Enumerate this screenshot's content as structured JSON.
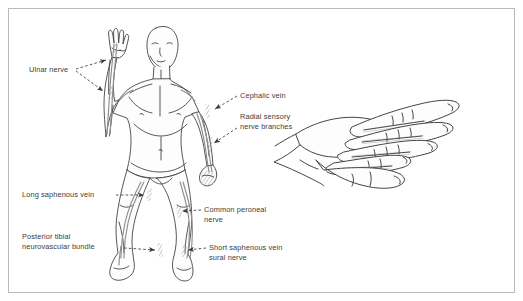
{
  "figure": {
    "kind": "anatomical-line-drawing",
    "border_color": "#b9b9b9",
    "background_color": "#ffffff",
    "ink_color": "#3a3a3a",
    "vessel_color": "#8e8e8e",
    "label_color": "#3c3c3c",
    "hatch_color": "#9a9a9a"
  },
  "panels": [
    {
      "id": "whole-body",
      "name": "Anterior whole body figure, right arm raised"
    },
    {
      "id": "hand-lateral",
      "name": "Lateral view of hand with extended fingers"
    }
  ],
  "labels": [
    {
      "id": "ulnar-nerve",
      "lines": [
        "Ulnar nerve"
      ],
      "text_x": 29,
      "text_y": 72,
      "anchor": "start",
      "leaders": [
        {
          "from_x": 76,
          "from_y": 69,
          "to_x": 110,
          "to_y": 61
        },
        {
          "from_x": 76,
          "from_y": 71,
          "to_x": 106,
          "to_y": 92
        }
      ]
    },
    {
      "id": "cephalic-vein",
      "lines": [
        "Cephalic vein"
      ],
      "text_x": 240,
      "text_y": 98,
      "anchor": "start",
      "leaders": [
        {
          "from_x": 237,
          "from_y": 96,
          "to_x": 214,
          "to_y": 108
        }
      ]
    },
    {
      "id": "radial-sensory-nerve-branches",
      "lines": [
        "Radial sensory",
        "nerve branches"
      ],
      "text_x": 240,
      "text_y": 119,
      "anchor": "start",
      "leaders": [
        {
          "from_x": 237,
          "from_y": 128,
          "to_x": 212,
          "to_y": 142
        }
      ]
    },
    {
      "id": "long-saphenous-vein",
      "lines": [
        "Long saphenous vein"
      ],
      "text_x": 22,
      "text_y": 197,
      "anchor": "start",
      "leaders": [
        {
          "from_x": 116,
          "from_y": 195,
          "to_x": 146,
          "to_y": 195
        }
      ]
    },
    {
      "id": "posterior-tibial-neurovascular-bundle",
      "lines": [
        "Posterior tibial",
        "neurovascular bundle"
      ],
      "text_x": 22,
      "text_y": 239,
      "anchor": "start",
      "leaders": [
        {
          "from_x": 124,
          "from_y": 248,
          "to_x": 158,
          "to_y": 250
        }
      ]
    },
    {
      "id": "common-peroneal-nerve",
      "lines": [
        "Common peroneal",
        "nerve"
      ],
      "text_x": 204,
      "text_y": 212,
      "anchor": "start",
      "leaders": [
        {
          "from_x": 201,
          "from_y": 210,
          "to_x": 178,
          "to_y": 211
        }
      ]
    },
    {
      "id": "short-saphenous-vein-sural-nerve",
      "lines": [
        "Short saphenous vein",
        "sural nerve"
      ],
      "text_x": 209,
      "text_y": 250,
      "anchor": "start",
      "leaders": [
        {
          "from_x": 206,
          "from_y": 248,
          "to_x": 183,
          "to_y": 250
        }
      ]
    }
  ]
}
